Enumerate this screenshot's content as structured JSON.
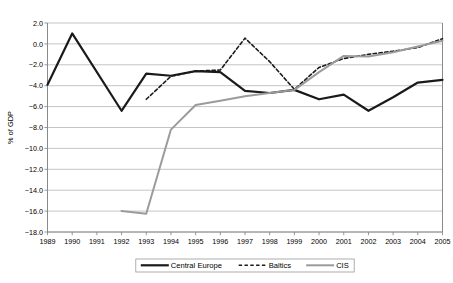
{
  "chart_data": {
    "type": "line",
    "title": "",
    "subtitle": "",
    "xlabel": "",
    "ylabel": "% of GDP",
    "x": [
      1989,
      1990,
      1991,
      1992,
      1993,
      1994,
      1995,
      1996,
      1997,
      1998,
      1999,
      2000,
      2001,
      2002,
      2003,
      2004,
      2005
    ],
    "xtick_labels": [
      "1989",
      "1990",
      "1991",
      "1992",
      "1993",
      "1994",
      "1995",
      "1996",
      "1997",
      "1998",
      "1999",
      "2000",
      "2001",
      "2002",
      "2003",
      "2004",
      "2005"
    ],
    "ytick_labels": [
      "2.0",
      "0.0",
      "-2.0",
      "-4.0",
      "-6.0",
      "-8.0",
      "-10.0",
      "-12.0",
      "-14.0",
      "-16.0",
      "-18.0"
    ],
    "ytick_values": [
      2.0,
      0.0,
      -2.0,
      -4.0,
      -6.0,
      -8.0,
      -10.0,
      -12.0,
      -14.0,
      -16.0,
      -18.0
    ],
    "ylim": [
      -18.0,
      2.0
    ],
    "xlim": [
      1989,
      2005
    ],
    "grid": "horizontal",
    "legend_position": "bottom",
    "series": [
      {
        "name": "Central Europe",
        "style": "solid",
        "color": "#1a1a1a",
        "width": 2.2,
        "x": [
          1989,
          1990,
          1992,
          1993,
          1994,
          1995,
          1996,
          1997,
          1998,
          1999,
          2000,
          2001,
          2002,
          2003,
          2004,
          2005
        ],
        "values": [
          -3.9,
          1.0,
          -6.4,
          -2.85,
          -3.05,
          -2.6,
          -2.7,
          -4.5,
          -4.7,
          -4.4,
          -5.3,
          -4.85,
          -6.4,
          -5.1,
          -3.7,
          -3.45
        ]
      },
      {
        "name": "Baltics",
        "style": "dashed",
        "color": "#1a1a1a",
        "width": 1.6,
        "x": [
          1993,
          1994,
          1995,
          1996,
          1997,
          1998,
          1999,
          2000,
          2001,
          2002,
          2003,
          2004,
          2005
        ],
        "values": [
          -5.3,
          -3.1,
          -2.6,
          -2.5,
          0.55,
          -1.7,
          -4.35,
          -2.25,
          -1.4,
          -1.0,
          -0.7,
          -0.35,
          0.5
        ]
      },
      {
        "name": "CIS",
        "style": "solid",
        "color": "#9b9b9b",
        "width": 2.0,
        "x": [
          1992,
          1993,
          1994,
          1995,
          1996,
          1997,
          1998,
          1999,
          2000,
          2001,
          2002,
          2003,
          2004,
          2005
        ],
        "values": [
          -16.0,
          -16.25,
          -8.2,
          -5.85,
          -5.45,
          -5.0,
          -4.7,
          -4.4,
          -2.7,
          -1.15,
          -1.2,
          -0.8,
          -0.25,
          0.3
        ]
      }
    ]
  },
  "axis": {
    "y_title": "% of GDP"
  },
  "legend": {
    "items": [
      {
        "label": "Central Europe",
        "style": "solid",
        "color": "#1a1a1a"
      },
      {
        "label": "Baltics",
        "style": "dashed",
        "color": "#1a1a1a"
      },
      {
        "label": "CIS",
        "style": "solid",
        "color": "#9b9b9b"
      }
    ]
  },
  "colors": {
    "central_europe": "#1a1a1a",
    "baltics": "#1a1a1a",
    "cis": "#9b9b9b",
    "grid": "#bdbdbd",
    "axis": "#8a8a8a",
    "background": "#ffffff"
  }
}
